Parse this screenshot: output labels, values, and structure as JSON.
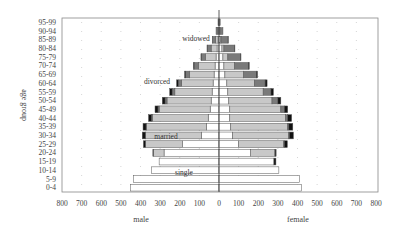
{
  "chart_data": {
    "type": "bar",
    "subtype": "population-pyramid-stacked",
    "title": "",
    "xlabel_left": "male",
    "xlabel_right": "female",
    "ylabel": "age group",
    "x_ticks_left": [
      "800",
      "700",
      "600",
      "500",
      "400",
      "300",
      "200",
      "100",
      "0"
    ],
    "x_ticks_right": [
      "0",
      "100",
      "200",
      "300",
      "400",
      "500",
      "600",
      "700",
      "800"
    ],
    "xlim": [
      -800,
      800
    ],
    "grid": "dotted vertical",
    "categories": [
      "0-4",
      "5-9",
      "10-14",
      "15-19",
      "20-24",
      "25-29",
      "30-34",
      "35-39",
      "40-44",
      "45-49",
      "50-54",
      "55-59",
      "60-64",
      "65-69",
      "70-74",
      "75-79",
      "80-84",
      "85-89",
      "90-94",
      "95-99"
    ],
    "series_order": [
      "single",
      "married",
      "widowed",
      "divorced"
    ],
    "colors": {
      "single": "#ffffff",
      "married": "#c8c8c8",
      "widowed": "#7a7a7a",
      "divorced": "#111111"
    },
    "male": {
      "single": [
        450,
        435,
        345,
        305,
        280,
        185,
        90,
        65,
        55,
        45,
        40,
        35,
        30,
        25,
        20,
        15,
        10,
        5,
        3,
        1
      ],
      "married": [
        0,
        0,
        0,
        0,
        55,
        190,
        285,
        305,
        285,
        260,
        225,
        190,
        160,
        125,
        85,
        55,
        30,
        12,
        4,
        1
      ],
      "widowed": [
        0,
        0,
        0,
        0,
        0,
        0,
        1,
        2,
        4,
        6,
        10,
        14,
        18,
        20,
        22,
        20,
        20,
        15,
        8,
        3
      ],
      "divorced": [
        0,
        0,
        0,
        0,
        2,
        10,
        15,
        15,
        15,
        15,
        14,
        12,
        8,
        5,
        3,
        2,
        1,
        1,
        0,
        0
      ]
    },
    "female": {
      "single": [
        420,
        410,
        305,
        280,
        160,
        100,
        70,
        60,
        55,
        55,
        50,
        45,
        40,
        30,
        25,
        20,
        15,
        8,
        4,
        1
      ],
      "married": [
        0,
        0,
        0,
        0,
        125,
        230,
        285,
        290,
        285,
        260,
        220,
        180,
        140,
        95,
        55,
        25,
        10,
        3,
        1,
        0
      ],
      "widowed": [
        0,
        0,
        0,
        0,
        1,
        3,
        4,
        6,
        10,
        18,
        30,
        40,
        55,
        65,
        70,
        65,
        55,
        35,
        15,
        5
      ],
      "divorced": [
        0,
        0,
        0,
        10,
        5,
        15,
        20,
        20,
        20,
        17,
        15,
        12,
        10,
        6,
        4,
        2,
        1,
        1,
        0,
        0
      ]
    },
    "annotations": [
      {
        "text": "widowed",
        "age_group": "85-89",
        "side": "male"
      },
      {
        "text": "divorced",
        "age_group": "60-64",
        "side": "male"
      },
      {
        "text": "married",
        "age_group": "30-34",
        "side": "male"
      },
      {
        "text": "single",
        "age_group": "10-14",
        "side": "male"
      }
    ]
  }
}
